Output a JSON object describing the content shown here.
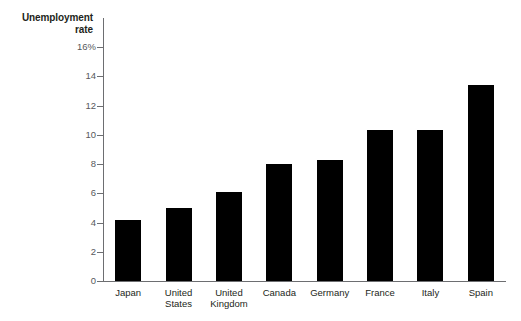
{
  "chart_data": {
    "type": "bar",
    "title": "Unemployment rate",
    "title_line1": "Unemployment",
    "title_line2": "rate",
    "xlabel": "",
    "ylabel": "Unemployment rate",
    "ylim": [
      0,
      16
    ],
    "y_tick_values": [
      16,
      14,
      12,
      10,
      8,
      6,
      4,
      2,
      0
    ],
    "y_tick_labels": [
      "16%",
      "14",
      "12",
      "10",
      "8",
      "6",
      "4",
      "2",
      "0"
    ],
    "grid": false,
    "legend": false,
    "bar_color": "#000000",
    "axis_color": "#6d6e71",
    "categories": [
      "Japan",
      "United States",
      "United Kingdom",
      "Canada",
      "Germany",
      "France",
      "Italy",
      "Spain"
    ],
    "category_lines": [
      [
        "Japan"
      ],
      [
        "United",
        "States"
      ],
      [
        "United",
        "Kingdom"
      ],
      [
        "Canada"
      ],
      [
        "Germany"
      ],
      [
        "France"
      ],
      [
        "Italy"
      ],
      [
        "Spain"
      ]
    ],
    "values": [
      4.2,
      5.0,
      6.1,
      8.0,
      8.3,
      10.3,
      10.3,
      13.4
    ]
  }
}
